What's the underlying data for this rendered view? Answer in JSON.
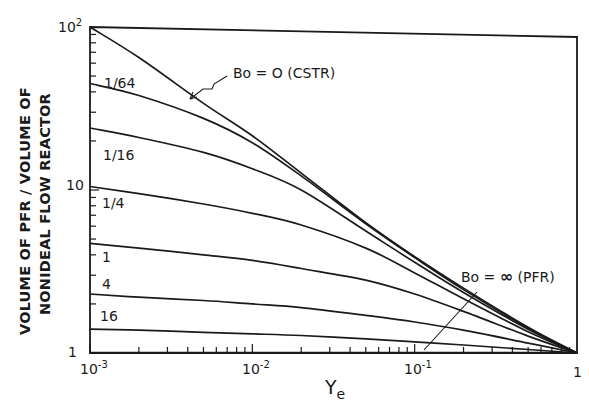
{
  "chart_data": {
    "type": "line",
    "title": "",
    "xlabel": "Y_e",
    "xlabel_main": "Y",
    "xlabel_sub": "e",
    "ylabel_lines": [
      "VOLUME OF PFR / VOLUME OF",
      "NONIDEAL FLOW REACTOR"
    ],
    "x_scale": "log",
    "y_scale": "log",
    "xlim": [
      0.001,
      1
    ],
    "ylim": [
      1,
      100
    ],
    "grid": false,
    "x_ticks": [
      {
        "value": 0.001,
        "label_base": "10",
        "label_exp": "-3"
      },
      {
        "value": 0.01,
        "label_base": "10",
        "label_exp": "-2"
      },
      {
        "value": 0.1,
        "label_base": "10",
        "label_exp": "-1"
      },
      {
        "value": 1,
        "label_base": "1",
        "label_exp": ""
      }
    ],
    "y_ticks": [
      {
        "value": 1,
        "label_base": "1",
        "label_exp": ""
      },
      {
        "value": 10,
        "label_base": "10",
        "label_exp": ""
      },
      {
        "value": 100,
        "label_base": "10",
        "label_exp": "2"
      }
    ],
    "x": [
      0.001,
      0.002,
      0.005,
      0.01,
      0.02,
      0.05,
      0.1,
      0.2,
      0.5,
      1.0
    ],
    "series": [
      {
        "name": "Bo = 0 (CSTR)",
        "label": "",
        "values": [
          100,
          65,
          34,
          21.5,
          12.7,
          6.3,
          3.9,
          2.5,
          1.44,
          1.0
        ]
      },
      {
        "name": "Bo = 1/64",
        "label": "1/64",
        "values": [
          45,
          38,
          27.5,
          19.5,
          12.2,
          6.2,
          3.85,
          2.45,
          1.42,
          1.0
        ]
      },
      {
        "name": "Bo = 1/16",
        "label": "1/16",
        "values": [
          24,
          21,
          17,
          13.5,
          10,
          5.6,
          3.6,
          2.35,
          1.4,
          1.0
        ]
      },
      {
        "name": "Bo = 1/4",
        "label": "1/4",
        "values": [
          10.5,
          9.5,
          8.2,
          7.2,
          6.1,
          4.4,
          3.1,
          2.15,
          1.35,
          1.0
        ]
      },
      {
        "name": "Bo = 1",
        "label": "1",
        "values": [
          4.7,
          4.4,
          4.0,
          3.7,
          3.3,
          2.8,
          2.3,
          1.8,
          1.27,
          1.0
        ]
      },
      {
        "name": "Bo = 4",
        "label": "4",
        "values": [
          2.3,
          2.2,
          2.1,
          2.0,
          1.9,
          1.7,
          1.55,
          1.38,
          1.15,
          1.0
        ]
      },
      {
        "name": "Bo = 16",
        "label": "16",
        "values": [
          1.4,
          1.38,
          1.34,
          1.31,
          1.28,
          1.22,
          1.17,
          1.12,
          1.05,
          1.0
        ]
      },
      {
        "name": "Bo = ∞ (PFR)",
        "label": "",
        "values": [
          1,
          1,
          1,
          1,
          1,
          1,
          1,
          1,
          1,
          1
        ]
      }
    ],
    "annotations": [
      {
        "text": "Bo = O (CSTR)",
        "points_to": "Bo = 0 (CSTR) curve near Y_e = 0.004"
      },
      {
        "text": "Bo = ∞ (PFR)",
        "points_to": "Bo = ∞ (PFR) line near Y_e = 0.1"
      }
    ]
  },
  "labels": {
    "cstr_annotation": "Bo = O (CSTR)",
    "pfr_annotation_prefix": "Bo = ",
    "pfr_annotation_symbol": "∞",
    "pfr_annotation_suffix": " (PFR)",
    "y_axis_line1": "VOLUME OF PFR / VOLUME OF",
    "y_axis_line2": "NONIDEAL FLOW REACTOR",
    "x_axis_main": "Y",
    "x_axis_sub": "e",
    "curve_1_64": "1/64",
    "curve_1_16": "1/16",
    "curve_1_4": "1/4",
    "curve_1": "1",
    "curve_4": "4",
    "curve_16": "16",
    "xtick_base_10": "10",
    "xtick_exp_m3": "-3",
    "xtick_exp_m2": "-2",
    "xtick_exp_m1": "-1",
    "xtick_1": "1",
    "ytick_1": "1",
    "ytick_10": "10",
    "ytick_100_base": "10",
    "ytick_100_exp": "2"
  }
}
